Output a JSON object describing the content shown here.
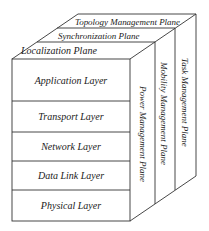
{
  "diagram": {
    "front_layers": [
      {
        "label": "Application Layer"
      },
      {
        "label": "Transport Layer"
      },
      {
        "label": "Network Layer"
      },
      {
        "label": "Data Link Layer"
      },
      {
        "label": "Physical Layer"
      }
    ],
    "top_planes": [
      {
        "label": "Localization Plane"
      },
      {
        "label": "Synchronization Plane"
      },
      {
        "label": "Topology Management Plane"
      }
    ],
    "side_planes": [
      {
        "label": "Power Management Plane"
      },
      {
        "label": "Mobility Management Plane"
      },
      {
        "label": "Task Management Plane"
      }
    ],
    "colors": {
      "line": "#333333",
      "text": "#1a1a1a",
      "background": "#ffffff"
    }
  }
}
